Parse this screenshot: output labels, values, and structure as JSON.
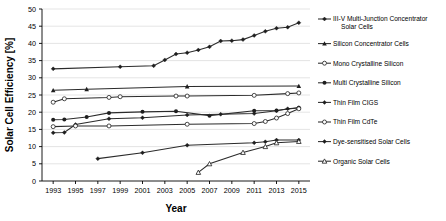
{
  "chart_data": {
    "type": "line",
    "title": "",
    "xlabel": "Year",
    "ylabel": "Solar Cell Efficiency [%]",
    "xlim": [
      1992,
      2016
    ],
    "ylim": [
      0,
      50
    ],
    "ytick_step": 5,
    "yticks": [
      0,
      5,
      10,
      15,
      20,
      25,
      30,
      35,
      40,
      45,
      50
    ],
    "xticks": [
      1993,
      1995,
      1997,
      1999,
      2001,
      2003,
      2005,
      2007,
      2009,
      2011,
      2013,
      2015
    ],
    "grid": true,
    "legend_position": "right",
    "series": [
      {
        "name": "III-V Multi-Junction Concentrator Solar Cells",
        "marker": "filled-diamond",
        "x": [
          1993,
          1999,
          2002,
          2003,
          2004,
          2005,
          2006,
          2007,
          2008,
          2009,
          2010,
          2011,
          2012,
          2013,
          2014,
          2015
        ],
        "values": [
          32.6,
          33.2,
          33.5,
          35.2,
          36.9,
          37.3,
          38.1,
          39.0,
          40.7,
          40.8,
          41.1,
          42.3,
          43.5,
          44.4,
          44.7,
          46.0
        ]
      },
      {
        "name": "Silicon Concentrator Cells",
        "marker": "filled-triangle",
        "x": [
          1993,
          1996,
          2005,
          2015
        ],
        "values": [
          26.4,
          26.7,
          27.5,
          27.6
        ]
      },
      {
        "name": "Mono Crystalline Silicon",
        "marker": "open-circle",
        "x": [
          1993,
          1994,
          1998,
          1999,
          2004,
          2005,
          2011,
          2014,
          2015
        ],
        "values": [
          22.9,
          23.9,
          24.3,
          24.5,
          24.7,
          24.7,
          24.9,
          25.4,
          25.6
        ]
      },
      {
        "name": "Multi Crystalline Silicon",
        "marker": "filled-circle",
        "x": [
          1993,
          1994,
          1996,
          1998,
          2001,
          2004,
          2007,
          2011,
          2013,
          2015
        ],
        "values": [
          17.8,
          17.9,
          18.6,
          19.8,
          20.1,
          20.3,
          19.0,
          20.4,
          20.5,
          21.3
        ]
      },
      {
        "name": "Thin Film CIGS",
        "marker": "filled-diamond",
        "x": [
          1993,
          1994,
          1995,
          1998,
          2001,
          2005,
          2008,
          2011,
          2013,
          2014,
          2015
        ],
        "values": [
          14.0,
          14.1,
          16.4,
          18.1,
          18.4,
          19.2,
          19.4,
          19.6,
          20.4,
          21.0,
          21.3
        ]
      },
      {
        "name": "Thin Film CdTe",
        "marker": "open-circle",
        "x": [
          1993,
          1995,
          1998,
          2005,
          2011,
          2012,
          2013,
          2014,
          2015
        ],
        "values": [
          15.8,
          16.0,
          16.0,
          16.5,
          16.7,
          17.3,
          18.3,
          19.6,
          21.0
        ]
      },
      {
        "name": "Dye-sensitised Solar Cells",
        "marker": "filled-diamond",
        "x": [
          1997,
          2001,
          2005,
          2011,
          2012,
          2013,
          2015
        ],
        "values": [
          6.5,
          8.2,
          10.4,
          11.1,
          11.4,
          11.9,
          11.9
        ]
      },
      {
        "name": "Organic Solar Cells",
        "marker": "open-triangle",
        "x": [
          2006,
          2007,
          2010,
          2012,
          2013,
          2015
        ],
        "values": [
          2.5,
          5.0,
          8.3,
          10.0,
          11.1,
          11.5
        ]
      }
    ]
  },
  "legend": {
    "items": [
      {
        "label": "III-V Multi-Junction Concentrator Solar Cells",
        "marker": "filled-diamond"
      },
      {
        "label": "Silicon Concentrator Cells",
        "marker": "filled-triangle"
      },
      {
        "label": "Mono Crystalline Silicon",
        "marker": "open-circle"
      },
      {
        "label": "Multi Crystalline Silicon",
        "marker": "filled-circle"
      },
      {
        "label": "Thin Film CIGS",
        "marker": "filled-diamond"
      },
      {
        "label": "Thin Film CdTe",
        "marker": "open-circle"
      },
      {
        "label": "Dye-sensitised Solar Cells",
        "marker": "filled-diamond"
      },
      {
        "label": "Organic Solar Cells",
        "marker": "open-triangle"
      }
    ]
  },
  "colors": {
    "line": "#2b2b2b",
    "grid": "#c9c9c9",
    "axis": "#000000",
    "background": "#ffffff"
  }
}
